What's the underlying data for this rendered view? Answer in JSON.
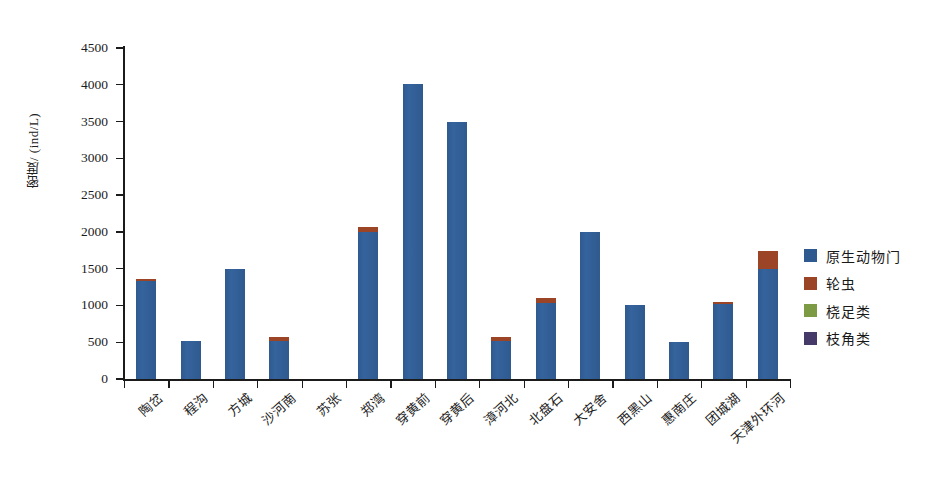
{
  "chart_data": {
    "type": "bar",
    "stacked": true,
    "title": "",
    "xlabel": "",
    "ylabel": "密度/ (ind/L)",
    "ylim": [
      0,
      4500
    ],
    "ytick_step": 500,
    "yticks": [
      0,
      500,
      1000,
      1500,
      2000,
      2500,
      3000,
      3500,
      4000,
      4500
    ],
    "grid": false,
    "legend_position": "right",
    "categories": [
      "陶岔",
      "程沟",
      "方城",
      "沙河南",
      "苏张",
      "郑湾",
      "穿黄前",
      "穿黄后",
      "漳河北",
      "北盘石",
      "大安舍",
      "西黑山",
      "惠南庄",
      "团城湖",
      "天津外环河"
    ],
    "series": [
      {
        "name": "原生动物门",
        "color": "#2f5a90",
        "values": [
          1330,
          515,
          1500,
          520,
          0,
          2000,
          4010,
          3500,
          520,
          1040,
          2000,
          1000,
          500,
          1020,
          1500
        ]
      },
      {
        "name": "轮虫",
        "color": "#9c4526",
        "values": [
          30,
          0,
          0,
          50,
          0,
          60,
          0,
          0,
          50,
          60,
          0,
          0,
          0,
          30,
          240
        ]
      },
      {
        "name": "桡足类",
        "color": "#7d9a45",
        "values": [
          0,
          0,
          0,
          0,
          0,
          0,
          0,
          0,
          0,
          0,
          0,
          0,
          0,
          0,
          0
        ]
      },
      {
        "name": "枝角类",
        "color": "#453a68",
        "values": [
          0,
          0,
          0,
          0,
          0,
          0,
          0,
          0,
          0,
          0,
          0,
          0,
          0,
          0,
          0
        ]
      }
    ],
    "totals": [
      1360,
      515,
      1500,
      570,
      0,
      2060,
      4010,
      3500,
      570,
      1100,
      2000,
      1000,
      500,
      1050,
      1740
    ]
  },
  "legend": {
    "items": [
      {
        "label": "原生动物门",
        "color": "#2f5a90",
        "swatch_name": "legend-swatch-protozoa"
      },
      {
        "label": "轮虫",
        "color": "#9c4526",
        "swatch_name": "legend-swatch-rotifer"
      },
      {
        "label": "桡足类",
        "color": "#7d9a45",
        "swatch_name": "legend-swatch-copepod"
      },
      {
        "label": "枝角类",
        "color": "#453a68",
        "swatch_name": "legend-swatch-cladocera"
      }
    ]
  }
}
